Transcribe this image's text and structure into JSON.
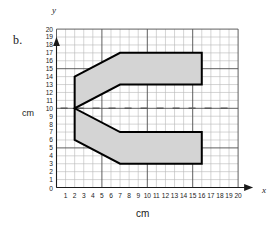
{
  "figure": {
    "part_label": "b.",
    "axis_x_name": "x",
    "axis_y_name": "y",
    "axis_x_unit": "cm",
    "axis_y_unit": "cm",
    "origin_label": "0"
  },
  "chart_data": {
    "type": "scatter",
    "title": "",
    "xlabel": "cm",
    "ylabel": "cm",
    "xlim": [
      0,
      20
    ],
    "ylim": [
      0,
      20
    ],
    "grid": true,
    "grid_minor_step": 1,
    "grid_major_step": 5,
    "legend": "none",
    "x_ticks": [
      1,
      2,
      3,
      4,
      5,
      6,
      7,
      8,
      9,
      10,
      11,
      12,
      13,
      14,
      15,
      16,
      17,
      18,
      19,
      20
    ],
    "y_ticks": [
      1,
      2,
      3,
      4,
      5,
      6,
      7,
      8,
      9,
      10,
      11,
      12,
      13,
      14,
      15,
      16,
      17,
      18,
      19,
      20
    ],
    "annotations": [
      {
        "name": "centerline",
        "type": "dashed-horizontal-line",
        "y": 10,
        "x_from": 1,
        "x_to": 20
      }
    ],
    "shapes": [
      {
        "name": "fork-polygon",
        "fill": "#d4d4d4",
        "stroke": "#000000",
        "stroke_width": 2,
        "closed": true,
        "vertices": [
          [
            2,
            14
          ],
          [
            7,
            17
          ],
          [
            16,
            17
          ],
          [
            16,
            13
          ],
          [
            7,
            13
          ],
          [
            2,
            10
          ],
          [
            7,
            7
          ],
          [
            16,
            7
          ],
          [
            16,
            3
          ],
          [
            7,
            3
          ],
          [
            2,
            6
          ]
        ]
      }
    ]
  },
  "colors": {
    "shape_fill": "#d4d4d4",
    "shape_stroke": "#000000",
    "grid_minor": "#b9b9b9",
    "grid_major": "#4d4d4d",
    "axis": "#1a1a1a",
    "dash": "#5a5a5a",
    "background": "#ffffff"
  }
}
